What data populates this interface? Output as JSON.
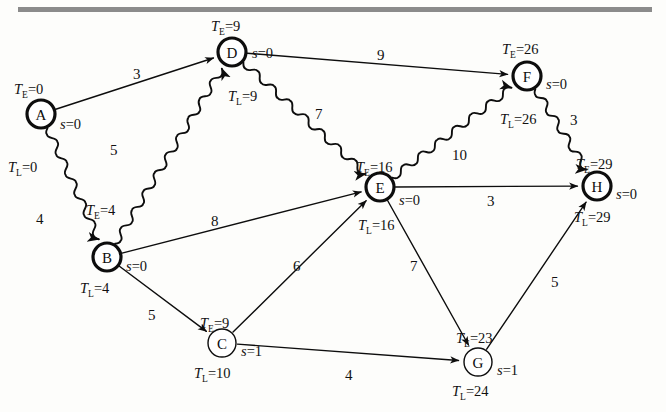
{
  "figure": {
    "kind": "activity-network-diagram",
    "top_rule_color": "#8b8b8b",
    "background_color": "#fdfdfb",
    "ink_color": "#0d0d0d"
  },
  "nodes": [
    {
      "id": "A",
      "label": "A",
      "cx": 41,
      "cy": 114,
      "r": 14,
      "critical": true,
      "te_text": "T",
      "te_sub": "E",
      "te_val": "=0",
      "tl_text": "T",
      "tl_sub": "L",
      "tl_val": "=0",
      "s_text": "s",
      "s_val": "=0",
      "te_x": 14,
      "te_y": 82,
      "tl_x": 8,
      "tl_y": 160,
      "s_x": 60,
      "s_y": 117
    },
    {
      "id": "B",
      "label": "B",
      "cx": 107,
      "cy": 257,
      "r": 14,
      "critical": true,
      "te_text": "T",
      "te_sub": "E",
      "te_val": "=4",
      "tl_text": "T",
      "tl_sub": "L",
      "tl_val": "=4",
      "s_text": "s",
      "s_val": "=0",
      "te_x": 86,
      "te_y": 203,
      "tl_x": 80,
      "tl_y": 281,
      "s_x": 126,
      "s_y": 259
    },
    {
      "id": "C",
      "label": "C",
      "cx": 222,
      "cy": 343,
      "r": 14,
      "critical": false,
      "te_text": "T",
      "te_sub": "E",
      "te_val": "=9",
      "tl_text": "T",
      "tl_sub": "L",
      "tl_val": "=10",
      "s_text": "s",
      "s_val": "=1",
      "te_x": 200,
      "te_y": 316,
      "tl_x": 194,
      "tl_y": 366,
      "s_x": 241,
      "s_y": 344
    },
    {
      "id": "D",
      "label": "D",
      "cx": 232,
      "cy": 52,
      "r": 14,
      "critical": true,
      "te_text": "T",
      "te_sub": "E",
      "te_val": "=9",
      "tl_text": "T",
      "tl_sub": "L",
      "tl_val": "=9",
      "s_text": "s",
      "s_val": "=0",
      "te_x": 211,
      "te_y": 19,
      "tl_x": 228,
      "tl_y": 89,
      "s_x": 252,
      "s_y": 46
    },
    {
      "id": "E",
      "label": "E",
      "cx": 380,
      "cy": 187,
      "r": 14,
      "critical": true,
      "te_text": "T",
      "te_sub": "E",
      "te_val": "=16",
      "tl_text": "T",
      "tl_sub": "L",
      "tl_val": "=16",
      "s_text": "s",
      "s_val": "=0",
      "te_x": 356,
      "te_y": 160,
      "tl_x": 358,
      "tl_y": 218,
      "s_x": 399,
      "s_y": 193
    },
    {
      "id": "F",
      "label": "F",
      "cx": 527,
      "cy": 76,
      "r": 14,
      "critical": true,
      "te_text": "T",
      "te_sub": "E",
      "te_val": "=26",
      "tl_text": "T",
      "tl_sub": "L",
      "tl_val": "=26",
      "s_text": "s",
      "s_val": "=0",
      "te_x": 502,
      "te_y": 42,
      "tl_x": 500,
      "tl_y": 112,
      "s_x": 546,
      "s_y": 77
    },
    {
      "id": "G",
      "label": "G",
      "cx": 478,
      "cy": 362,
      "r": 14,
      "critical": false,
      "te_text": "T",
      "te_sub": "E",
      "te_val": "=23",
      "tl_text": "T",
      "tl_sub": "L",
      "tl_val": "=24",
      "s_text": "s",
      "s_val": "=1",
      "te_x": 456,
      "te_y": 331,
      "tl_x": 452,
      "tl_y": 384,
      "s_x": 497,
      "s_y": 363
    },
    {
      "id": "H",
      "label": "H",
      "cx": 597,
      "cy": 186,
      "r": 14,
      "critical": true,
      "te_text": "T",
      "te_sub": "E",
      "te_val": "=29",
      "tl_text": "T",
      "tl_sub": "L",
      "tl_val": "=29",
      "s_text": "s",
      "s_val": "=0",
      "te_x": 576,
      "te_y": 157,
      "tl_x": 574,
      "tl_y": 210,
      "s_x": 616,
      "s_y": 187
    }
  ],
  "edges": [
    {
      "from": "A",
      "to": "D",
      "weight": "3",
      "critical": false,
      "lx": 133,
      "ly": 67
    },
    {
      "from": "A",
      "to": "B",
      "weight": "4",
      "critical": true,
      "lx": 36,
      "ly": 212
    },
    {
      "from": "B",
      "to": "D",
      "weight": "5",
      "critical": true,
      "lx": 110,
      "ly": 143
    },
    {
      "from": "B",
      "to": "E",
      "weight": "8",
      "critical": false,
      "lx": 211,
      "ly": 214
    },
    {
      "from": "B",
      "to": "C",
      "weight": "5",
      "critical": false,
      "lx": 148,
      "ly": 308
    },
    {
      "from": "C",
      "to": "E",
      "weight": "6",
      "critical": false,
      "lx": 293,
      "ly": 259
    },
    {
      "from": "C",
      "to": "G",
      "weight": "4",
      "critical": false,
      "lx": 345,
      "ly": 368
    },
    {
      "from": "D",
      "to": "F",
      "weight": "9",
      "critical": false,
      "lx": 377,
      "ly": 48
    },
    {
      "from": "D",
      "to": "E",
      "weight": "7",
      "critical": true,
      "lx": 315,
      "ly": 107
    },
    {
      "from": "E",
      "to": "F",
      "weight": "10",
      "critical": true,
      "lx": 452,
      "ly": 148
    },
    {
      "from": "E",
      "to": "H",
      "weight": "3",
      "critical": false,
      "lx": 487,
      "ly": 194
    },
    {
      "from": "E",
      "to": "G",
      "weight": "7",
      "critical": false,
      "lx": 410,
      "ly": 259
    },
    {
      "from": "F",
      "to": "H",
      "weight": "3",
      "critical": true,
      "lx": 570,
      "ly": 113
    },
    {
      "from": "G",
      "to": "H",
      "weight": "5",
      "critical": false,
      "lx": 551,
      "ly": 275
    }
  ]
}
